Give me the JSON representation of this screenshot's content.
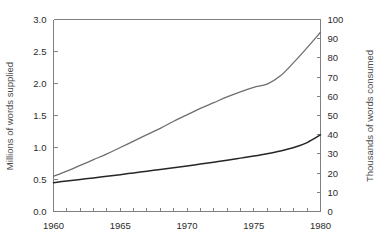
{
  "chart_data": {
    "type": "line",
    "title": "",
    "xlabel": "",
    "ylabel": "Millions of words supplied",
    "y2label": "Thousands of words consumed",
    "xlim": [
      1960,
      1980
    ],
    "ylim": [
      0.0,
      3.0
    ],
    "y2lim": [
      0,
      100
    ],
    "grid": false,
    "legend": "none",
    "x_tick_labels": [
      "1960",
      "1965",
      "1970",
      "1975",
      "1980"
    ],
    "x_tick_values": [
      1960,
      1965,
      1970,
      1975,
      1980
    ],
    "x_minor_ticks": [
      1960,
      1961,
      1962,
      1963,
      1964,
      1965,
      1966,
      1967,
      1968,
      1969,
      1970,
      1971,
      1972,
      1973,
      1974,
      1975,
      1976,
      1977,
      1978,
      1979,
      1980
    ],
    "y_tick_labels": [
      "0.0",
      "0.5",
      "1.0",
      "1.5",
      "2.0",
      "2.5",
      "3.0"
    ],
    "y_tick_values": [
      0.0,
      0.5,
      1.0,
      1.5,
      2.0,
      2.5,
      3.0
    ],
    "y2_tick_labels": [
      "0",
      "10",
      "20",
      "30",
      "40",
      "50",
      "60",
      "70",
      "80",
      "90",
      "100"
    ],
    "y2_tick_values": [
      0,
      10,
      20,
      30,
      40,
      50,
      60,
      70,
      80,
      90,
      100
    ],
    "x": [
      1960,
      1961,
      1962,
      1963,
      1964,
      1965,
      1966,
      1967,
      1968,
      1969,
      1970,
      1971,
      1972,
      1973,
      1974,
      1975,
      1976,
      1977,
      1978,
      1979,
      1980
    ],
    "series": [
      {
        "name": "Words supplied",
        "axis": "left",
        "color": "#6e6e6e",
        "width": 1.3,
        "values": [
          0.55,
          0.63,
          0.72,
          0.81,
          0.9,
          1.0,
          1.1,
          1.2,
          1.3,
          1.41,
          1.51,
          1.61,
          1.7,
          1.79,
          1.87,
          1.94,
          1.99,
          2.12,
          2.33,
          2.56,
          2.8
        ]
      },
      {
        "name": "Words consumed",
        "axis": "right",
        "color": "#262626",
        "width": 1.5,
        "values": [
          15.0,
          15.9,
          16.7,
          17.5,
          18.4,
          19.2,
          20.1,
          21.0,
          21.9,
          22.8,
          23.7,
          24.7,
          25.7,
          26.7,
          27.8,
          28.9,
          30.1,
          31.5,
          33.3,
          35.9,
          39.9
        ]
      }
    ]
  }
}
